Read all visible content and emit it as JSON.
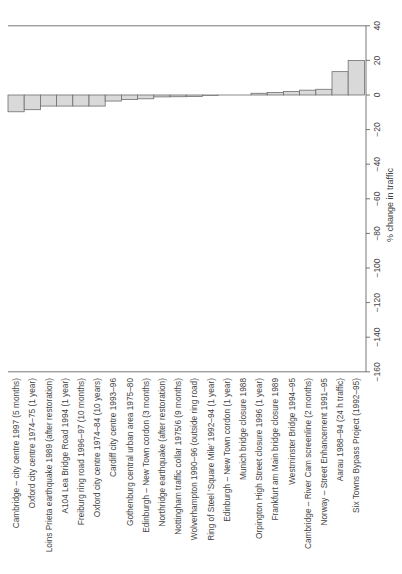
{
  "chart_data": {
    "type": "bar",
    "orientation": "vertical-bars-rotated-page",
    "title": "",
    "xlabel": "",
    "ylabel": "% change in traffic",
    "ylim": [
      -160,
      40
    ],
    "yticks": [
      40,
      20,
      0,
      -20,
      -40,
      -60,
      -80,
      -100,
      -120,
      -140,
      -160
    ],
    "grid": false,
    "legend": null,
    "categories": [
      "Cambridge – city centre 1997 (5 months)",
      "Oxford city centre 1974–75 (1 year)",
      "Loins Prieta earthquake 1989 (after restoration)",
      "A104 Lea Bridge Road 1994 (1 year)",
      "Freiburg ring road 1996–97 (10 months)",
      "Oxford city centre 1974–84 (10 years)",
      "Cardiff city centre 1993–96",
      "Gothenburg central urban area 1975–80",
      "Edinburgh – New Town cordon (3 months)",
      "Northridge earthquake (after restoration)",
      "Nottingham traffic collar 1975/6 (9 months)",
      "Wolverhampton 1990–96 (outside ring road)",
      "Ring of Steel 'Square Mile' 1992–94 (1 year)",
      "Edinburgh – New Town cordon (1 year)",
      "Munich bridge closure 1988",
      "Orpington High Street closure 1996 (1 year)",
      "Frankfurt am Main bridge closure 1989",
      "Westminster Bridge 1994–95",
      "Cambridge – River Cam screenline (2 months)",
      "Norway – Street Enhancement 1991–95",
      "Aarau 1988–94 (24 h traffic)",
      "Six Towns Bypass Project (1992–95)"
    ],
    "values": [
      -9.7,
      -8.5,
      -6.4,
      -6.4,
      -6.4,
      -6.4,
      -3.5,
      -2.6,
      -2.2,
      -1.1,
      -1.0,
      -0.8,
      -0.3,
      0,
      0,
      1.0,
      1.5,
      2.0,
      2.8,
      3.3,
      13.5,
      20.0
    ]
  },
  "colors": {
    "bar_fill": "#d9d9d9",
    "bar_stroke": "#6e6e6e",
    "axis": "#555555"
  }
}
